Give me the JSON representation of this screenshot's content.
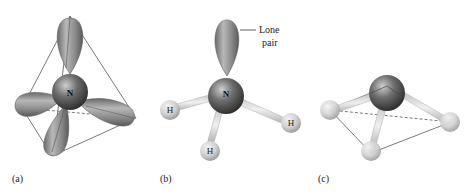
{
  "figure": {
    "panels": [
      {
        "id": "a",
        "label": "(a)",
        "central_atom": "N",
        "description": "sp3 hybrid orbitals of nitrogen in a tetrahedral arrangement"
      },
      {
        "id": "b",
        "label": "(b)",
        "central_atom": "N",
        "substituents": [
          "H",
          "H",
          "H"
        ],
        "annotation_line1": "Lone",
        "annotation_line2": "pair",
        "description": "Ammonia molecule with lone pair"
      },
      {
        "id": "c",
        "label": "(c)",
        "description": "Trigonal pyramidal molecular geometry"
      }
    ]
  },
  "colors": {
    "lobe": "#8c8c8c",
    "nitrogen": "#555555",
    "hydrogen": "#d4d4d4",
    "edge": "#6a6a6a"
  }
}
